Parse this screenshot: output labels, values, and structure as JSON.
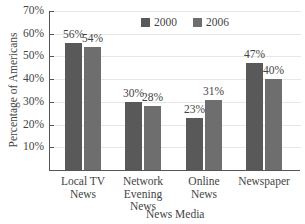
{
  "chart_data": {
    "type": "bar",
    "title": "",
    "xlabel": "News Media",
    "ylabel": "Percentage of Americans",
    "categories": [
      "Local TV\nNews",
      "Network\nEvening\nNews",
      "Online\nNews",
      "Newspaper"
    ],
    "series": [
      {
        "name": "2000",
        "values": [
          56,
          30,
          23,
          47
        ],
        "labels": [
          "56%",
          "30%",
          "23%",
          "47%"
        ],
        "color": "#595959"
      },
      {
        "name": "2006",
        "values": [
          54,
          28,
          31,
          40
        ],
        "labels": [
          "54%",
          "28%",
          "31%",
          "40%"
        ],
        "color": "#6e6e6e"
      }
    ],
    "yticks": [
      "10%",
      "20%",
      "30%",
      "40%",
      "50%",
      "60%",
      "70%"
    ],
    "ylim": [
      0,
      70
    ],
    "grid": true,
    "legend_position": "top-right"
  },
  "legend": {
    "items": [
      {
        "label": "2000",
        "color": "#595959"
      },
      {
        "label": "2006",
        "color": "#6e6e6e"
      }
    ]
  }
}
